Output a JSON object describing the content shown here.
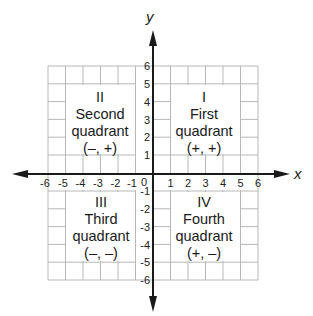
{
  "diagram": {
    "axes": {
      "x_label": "x",
      "y_label": "y",
      "origin_label": "0",
      "x_ticks": [
        "-6",
        "-5",
        "-4",
        "-3",
        "-2",
        "-1",
        "1",
        "2",
        "3",
        "4",
        "5",
        "6"
      ],
      "y_ticks": [
        "6",
        "5",
        "4",
        "3",
        "2",
        "1",
        "-1",
        "-2",
        "-3",
        "-4",
        "-5",
        "-6"
      ],
      "range": [
        -6,
        6
      ]
    },
    "quadrants": [
      {
        "numeral": "I",
        "name": "First",
        "word": "quadrant",
        "signs": "(+, +)"
      },
      {
        "numeral": "II",
        "name": "Second",
        "word": "quadrant",
        "signs": "(–, +)"
      },
      {
        "numeral": "III",
        "name": "Third",
        "word": "quadrant",
        "signs": "(–, –)"
      },
      {
        "numeral": "IV",
        "name": "Fourth",
        "word": "quadrant",
        "signs": "(+, –)"
      }
    ],
    "colors": {
      "grid": "#b5b5b5",
      "axis": "#1a1a1a",
      "text": "#1a1a1a"
    }
  }
}
